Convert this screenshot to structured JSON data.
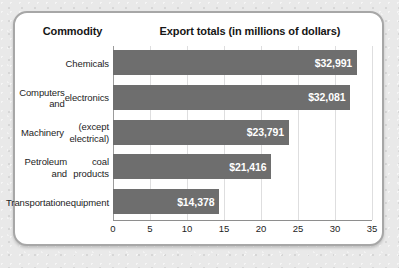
{
  "chart_data": {
    "type": "bar",
    "orientation": "horizontal",
    "title": "Export totals (in millions of dollars)",
    "category_header": "Commodity",
    "xlabel": "",
    "ylabel": "",
    "xlim": [
      0,
      35
    ],
    "xticks": [
      0,
      5,
      10,
      15,
      20,
      25,
      30,
      35
    ],
    "xtick_labels": [
      "0",
      "5",
      "10",
      "15",
      "20",
      "25",
      "30",
      "35"
    ],
    "grid": true,
    "legend": "none",
    "categories": [
      "Chemicals",
      "Computers and electronics",
      "Machinery (except electrical)",
      "Petroleum and coal products",
      "Transportation equipment"
    ],
    "category_lines": [
      [
        "Chemicals"
      ],
      [
        "Computers and",
        "electronics"
      ],
      [
        "Machinery",
        "(except electrical)"
      ],
      [
        "Petroleum and",
        "coal products"
      ],
      [
        "Transportation",
        "equipment"
      ]
    ],
    "values": [
      32.991,
      32.081,
      23.791,
      21.416,
      14.378
    ],
    "data_labels": [
      "$32,991",
      "$32,081",
      "$23,791",
      "$21,416",
      "$14,378"
    ],
    "bar_color": "#6e6e6e",
    "data_label_color": "#ffffff",
    "gridline_color": "#dededf",
    "axis_color": "#8e8e8e",
    "background_color": "#ffffff"
  }
}
